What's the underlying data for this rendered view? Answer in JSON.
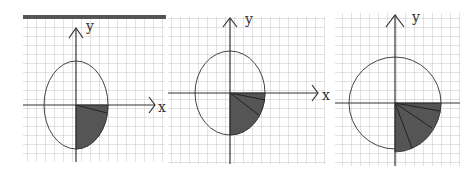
{
  "figure": {
    "panels": [
      {
        "id": "panel-1",
        "x_label": "x",
        "y_label": "y",
        "shape": "ellipse",
        "sectors_in_fourth_quadrant": 2,
        "shading": "fourth quadrant filled"
      },
      {
        "id": "panel-2",
        "x_label": "x",
        "y_label": "y",
        "shape": "ellipse",
        "sectors_in_fourth_quadrant": 3,
        "shading": "fourth quadrant filled"
      },
      {
        "id": "panel-3",
        "x_label": "x",
        "y_label": "y",
        "shape": "circle",
        "sectors_in_fourth_quadrant": 4,
        "shading": "fourth quadrant filled"
      }
    ],
    "colors": {
      "grid": "#b8b8b8",
      "axis": "#333333",
      "fill": "#555555",
      "top_bar": "#555555"
    }
  }
}
